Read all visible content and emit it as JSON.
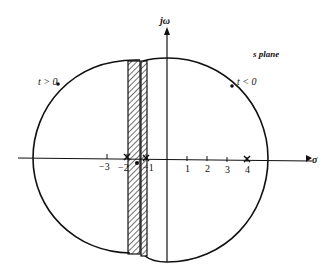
{
  "diagram": {
    "plane_label": "s plane",
    "y_axis_label": "jω",
    "x_axis_label": "σ",
    "region_left_label": "t > 0",
    "region_right_label": "t < 0",
    "tick_labels": [
      "−3",
      "−2",
      "−1",
      "1",
      "2",
      "3",
      "4"
    ],
    "markers": [
      {
        "type": "pole",
        "symbol": "×",
        "position": -2
      },
      {
        "type": "zero",
        "symbol": "∘",
        "position": -1.6
      },
      {
        "type": "pole",
        "symbol": "×",
        "position": -1
      },
      {
        "type": "pole",
        "symbol": "×",
        "position": 4
      }
    ],
    "shaded_strips": [
      {
        "from": -2.1,
        "to": -1.5
      },
      {
        "from": -1.4,
        "to": -1.1
      }
    ],
    "colors": {
      "ink": "#111111",
      "background": "#ffffff"
    }
  }
}
